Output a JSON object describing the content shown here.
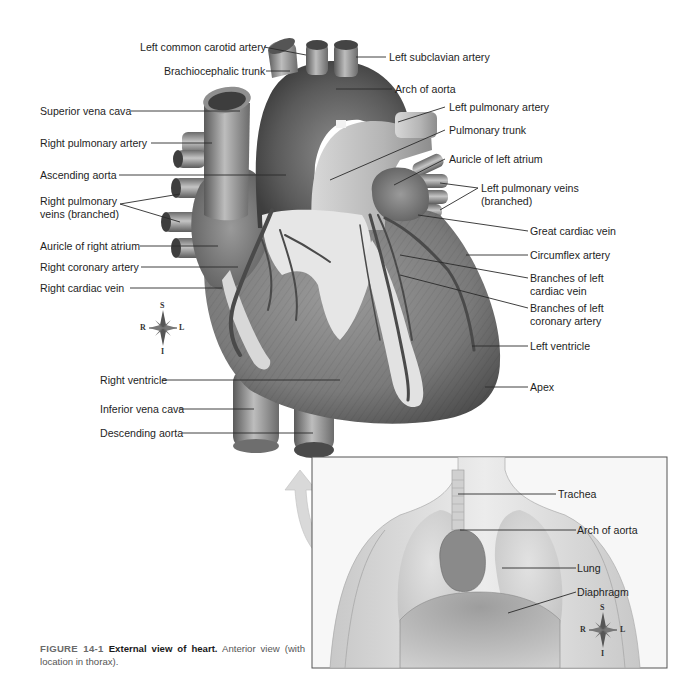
{
  "figure": {
    "number_label": "FIGURE 14-1",
    "title": "External view of heart.",
    "description": "Anterior view (with location in thorax)."
  },
  "heart_labels": {
    "left_side": [
      {
        "id": "superior-vena-cava",
        "text": "Superior vena cava"
      },
      {
        "id": "right-pulmonary-artery",
        "text": "Right pulmonary  artery"
      },
      {
        "id": "ascending-aorta",
        "text": "Ascending aorta"
      },
      {
        "id": "right-pulmonary-veins",
        "line1": "Right pulmonary",
        "line2": "veins (branched)"
      },
      {
        "id": "auricle-right-atrium",
        "text": "Auricle of right atrium"
      },
      {
        "id": "right-coronary-artery",
        "text": "Right coronary artery"
      },
      {
        "id": "right-cardiac-vein",
        "text": "Right cardiac vein"
      },
      {
        "id": "right-ventricle",
        "text": "Right ventricle"
      },
      {
        "id": "inferior-vena-cava",
        "text": "Inferior vena cava"
      },
      {
        "id": "descending-aorta",
        "text": "Descending aorta"
      }
    ],
    "top": [
      {
        "id": "left-common-carotid-artery",
        "text": "Left common carotid artery"
      },
      {
        "id": "brachiocephalic-trunk",
        "text": "Brachiocephalic trunk"
      },
      {
        "id": "left-subclavian-artery",
        "text": "Left subclavian artery"
      },
      {
        "id": "arch-of-aorta",
        "text": "Arch of aorta"
      }
    ],
    "right_side": [
      {
        "id": "left-pulmonary-artery",
        "text": "Left pulmonary artery"
      },
      {
        "id": "pulmonary-trunk",
        "text": "Pulmonary trunk"
      },
      {
        "id": "auricle-left-atrium",
        "text": "Auricle of left atrium"
      },
      {
        "id": "left-pulmonary-veins",
        "line1": "Left pulmonary veins",
        "line2": "(branched)"
      },
      {
        "id": "great-cardiac-vein",
        "text": "Great cardiac vein"
      },
      {
        "id": "circumflex-artery",
        "text": "Circumflex artery"
      },
      {
        "id": "branches-left-cardiac-vein",
        "line1": "Branches of left",
        "line2": "cardiac vein"
      },
      {
        "id": "branches-left-coronary-artery",
        "line1": "Branches of left",
        "line2": "coronary artery"
      },
      {
        "id": "left-ventricle",
        "text": "Left ventricle"
      },
      {
        "id": "apex",
        "text": "Apex"
      }
    ]
  },
  "thorax_labels": [
    {
      "id": "trachea",
      "text": "Trachea"
    },
    {
      "id": "arch-of-aorta-thorax",
      "text": "Arch of aorta"
    },
    {
      "id": "lung",
      "text": "Lung"
    },
    {
      "id": "diaphragm",
      "text": "Diaphragm"
    }
  ],
  "compass": {
    "superior": "S",
    "inferior": "I",
    "right": "R",
    "left": "L"
  },
  "colors": {
    "background": "#ffffff",
    "line": "#2a2a2a",
    "heart_dark": "#4a4a4a",
    "heart_mid": "#8a8a8a",
    "fat": "#e4e4e4",
    "arrow": "#d6d6d6",
    "inset_border": "#555555"
  }
}
